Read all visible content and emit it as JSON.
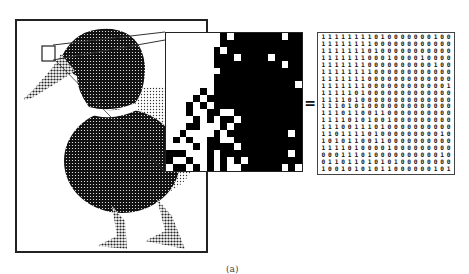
{
  "figure": {
    "caption": "(a)",
    "equals_sign": "=",
    "colors": {
      "ink": "#000000",
      "paper": "#ffffff",
      "frame": "#222222"
    },
    "duck_image": {
      "description": "dithered halftone image of a mallard duck",
      "zoom_box_label": "zoomed region near eye"
    },
    "pixel_grid": {
      "rows": 20,
      "cols": 20,
      "encoding": "1 = white pixel, 0 = black pixel"
    },
    "binary_matrix": {
      "rows": [
        "11111111010000000100",
        "11111111000000000000",
        "11111110100000000000",
        "11111110001000010000",
        "11111110000000000100",
        "11111111000000000000",
        "11111110000000000000",
        "11111110000000000001",
        "11111010000000000000",
        "11110100000000000000",
        "11101010000000000000",
        "11101100110000000000",
        "11110101001000000000",
        "11100111010000000000",
        "11011110100000000010",
        "10101100110000000000",
        "11110100001000000000",
        "00011101000000000010",
        "01101101010100000000",
        "10010101011000000101"
      ]
    }
  }
}
